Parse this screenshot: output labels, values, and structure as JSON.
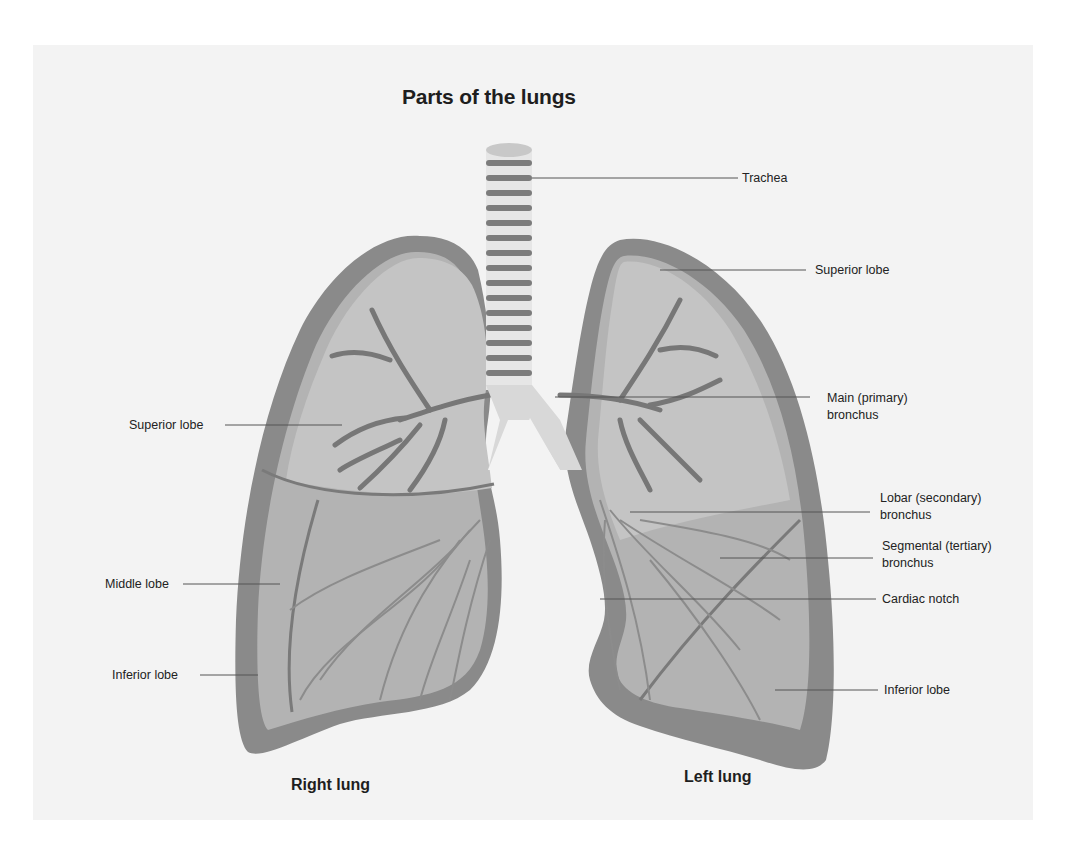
{
  "title": "Parts of the lungs",
  "colors": {
    "background": "#f3f3f3",
    "lung_outline": "#7a7a7a",
    "lung_fill": "#a9a9a9",
    "lung_inner": "#bdbdbd",
    "bronchi": "#6e6e6e",
    "trachea_ring": "#7c7c7c",
    "trachea_gap": "#e6e6e6",
    "text": "#222222"
  },
  "labels": {
    "trachea": "Trachea",
    "left_superior_lobe": "Superior lobe",
    "main_bronchus": "Main (primary)\nbronchus",
    "lobar_bronchus": "Lobar (secondary)\nbronchus",
    "segmental_bronchus": "Segmental (tertiary)\nbronchus",
    "cardiac_notch": "Cardiac notch",
    "left_inferior_lobe": "Inferior lobe",
    "right_superior_lobe": "Superior lobe",
    "right_middle_lobe": "Middle lobe",
    "right_inferior_lobe": "Inferior lobe"
  },
  "lungs": {
    "right": "Right lung",
    "left": "Left lung"
  }
}
